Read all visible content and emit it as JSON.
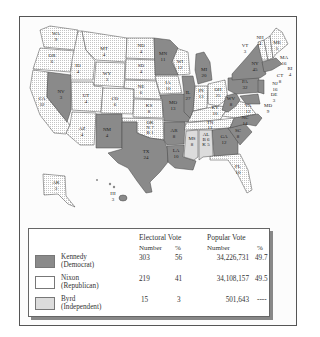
{
  "colors": {
    "democrat": "#8a8a8a",
    "republican_bg": "#ffffff",
    "republican_dots": "#bdbdbd",
    "independent": "#dcdcdc",
    "frame": "#555555",
    "background": "#fcfcfc"
  },
  "map": {
    "title": "",
    "states": [
      {
        "abbr": "WA",
        "ev": "9",
        "party": "R"
      },
      {
        "abbr": "OR",
        "ev": "6",
        "party": "R"
      },
      {
        "abbr": "CA",
        "ev": "32",
        "party": "R"
      },
      {
        "abbr": "ID",
        "ev": "4",
        "party": "R"
      },
      {
        "abbr": "NV",
        "ev": "3",
        "party": "D"
      },
      {
        "abbr": "MT",
        "ev": "4",
        "party": "R"
      },
      {
        "abbr": "WY",
        "ev": "3",
        "party": "R"
      },
      {
        "abbr": "UT",
        "ev": "4",
        "party": "R"
      },
      {
        "abbr": "AZ",
        "ev": "4",
        "party": "R"
      },
      {
        "abbr": "CO",
        "ev": "6",
        "party": "R"
      },
      {
        "abbr": "NM",
        "ev": "4",
        "party": "D"
      },
      {
        "abbr": "ND",
        "ev": "4",
        "party": "R"
      },
      {
        "abbr": "SD",
        "ev": "4",
        "party": "R"
      },
      {
        "abbr": "NE",
        "ev": "6",
        "party": "R"
      },
      {
        "abbr": "KS",
        "ev": "8",
        "party": "R"
      },
      {
        "abbr": "OK",
        "ev": "N 7 / B 1",
        "party": "R"
      },
      {
        "abbr": "TX",
        "ev": "24",
        "party": "D"
      },
      {
        "abbr": "MN",
        "ev": "11",
        "party": "D"
      },
      {
        "abbr": "IA",
        "ev": "10",
        "party": "R"
      },
      {
        "abbr": "MO",
        "ev": "13",
        "party": "D"
      },
      {
        "abbr": "AR",
        "ev": "8",
        "party": "D"
      },
      {
        "abbr": "LA",
        "ev": "10",
        "party": "D"
      },
      {
        "abbr": "WI",
        "ev": "12",
        "party": "R"
      },
      {
        "abbr": "IL",
        "ev": "27",
        "party": "D"
      },
      {
        "abbr": "MS",
        "ev": "8",
        "party": "I"
      },
      {
        "abbr": "MI",
        "ev": "20",
        "party": "D"
      },
      {
        "abbr": "IN",
        "ev": "13",
        "party": "R"
      },
      {
        "abbr": "KY",
        "ev": "10",
        "party": "R"
      },
      {
        "abbr": "TN",
        "ev": "11",
        "party": "R"
      },
      {
        "abbr": "AL",
        "ev": "K 5 / B 6",
        "party": "S"
      },
      {
        "abbr": "OH",
        "ev": "25",
        "party": "R"
      },
      {
        "abbr": "GA",
        "ev": "12",
        "party": "D"
      },
      {
        "abbr": "FL",
        "ev": "10",
        "party": "R"
      },
      {
        "abbr": "SC",
        "ev": "8",
        "party": "D"
      },
      {
        "abbr": "NC",
        "ev": "14",
        "party": "D"
      },
      {
        "abbr": "VA",
        "ev": "12",
        "party": "R"
      },
      {
        "abbr": "WV",
        "ev": "8",
        "party": "D"
      },
      {
        "abbr": "PA",
        "ev": "32",
        "party": "D"
      },
      {
        "abbr": "NY",
        "ev": "45",
        "party": "D"
      },
      {
        "abbr": "VT",
        "ev": "3",
        "party": "R"
      },
      {
        "abbr": "NH",
        "ev": "4",
        "party": "R"
      },
      {
        "abbr": "ME",
        "ev": "5",
        "party": "R"
      },
      {
        "abbr": "MA",
        "ev": "16",
        "party": "D"
      },
      {
        "abbr": "RI",
        "ev": "4",
        "party": "D"
      },
      {
        "abbr": "CT",
        "ev": "8",
        "party": "D"
      },
      {
        "abbr": "NJ",
        "ev": "16",
        "party": "D"
      },
      {
        "abbr": "DE",
        "ev": "3",
        "party": "D"
      },
      {
        "abbr": "MD",
        "ev": "9",
        "party": "D"
      },
      {
        "abbr": "AK",
        "ev": "3",
        "party": "R"
      },
      {
        "abbr": "HI",
        "ev": "3",
        "party": "D"
      }
    ]
  },
  "labels": {
    "WA": "WA",
    "WA_ev": "9",
    "OR": "OR",
    "OR_ev": "6",
    "CA": "CA",
    "CA_ev": "32",
    "ID": "ID",
    "ID_ev": "4",
    "NV": "NV",
    "NV_ev": "3",
    "MT": "MT",
    "MT_ev": "4",
    "WY": "WY",
    "WY_ev": "3",
    "UT": "UT",
    "UT_ev": "4",
    "AZ": "AZ",
    "AZ_ev": "4",
    "CO": "CO",
    "CO_ev": "6",
    "NM": "NM",
    "NM_ev": "4",
    "ND": "ND",
    "ND_ev": "4",
    "SD": "SD",
    "SD_ev": "4",
    "NE": "NE",
    "NE_ev": "6",
    "KS": "KS",
    "KS_ev": "8",
    "OK": "OK",
    "OK_ev1": "N 7",
    "OK_ev2": "B 1",
    "TX": "TX",
    "TX_ev": "24",
    "MN": "MN",
    "MN_ev": "11",
    "IA": "IA",
    "IA_ev": "10",
    "MO": "MO",
    "MO_ev": "13",
    "AR": "AR",
    "AR_ev": "8",
    "LA": "LA",
    "LA_ev": "10",
    "WI": "WI",
    "WI_ev": "12",
    "IL": "IL",
    "IL_ev": "27",
    "MS": "MS",
    "MS_ev": "8",
    "MI": "MI",
    "MI_ev": "20",
    "IN": "IN",
    "IN_ev": "13",
    "KY": "KY",
    "KY_ev": "10",
    "TN": "TN",
    "TN_ev": "11",
    "AL": "AL",
    "AL_ev1": "B 6",
    "AL_ev2": "K 5",
    "OH": "OH",
    "OH_ev": "25",
    "GA": "GA",
    "GA_ev": "12",
    "FL": "FL",
    "FL_ev": "10",
    "SC": "SC",
    "SC_ev": "8",
    "NC": "NC",
    "NC_ev": "14",
    "VA": "VA",
    "VA_ev": "12",
    "WV": "WV",
    "WV_ev": "8",
    "PA": "PA",
    "PA_ev": "32",
    "NY": "NY",
    "NY_ev": "45",
    "VT": "VT",
    "VT_ev": "3",
    "NH": "NH",
    "NH_ev": "4",
    "ME": "ME",
    "ME_ev": "5",
    "MA": "MA",
    "MA_ev": "16",
    "RI": "RI",
    "RI_ev": "4",
    "CT": "CT",
    "CT_ev": "8",
    "NJ": "NJ",
    "NJ_ev": "16",
    "DE": "DE",
    "DE_ev": "3",
    "MD": "MD",
    "MD_ev": "9",
    "AK": "AK",
    "AK_ev": "3",
    "HI": "HI",
    "HI_ev": "3"
  },
  "legend": {
    "headers": {
      "electoral": "Electoral Vote",
      "popular": "Popular Vote",
      "ev_number": "Number",
      "ev_pct": "%",
      "pv_number": "Number",
      "pv_pct": "%"
    },
    "rows": [
      {
        "name": "Kennedy",
        "party": "(Democrat)",
        "ev": "303",
        "ev_pct": "56",
        "pv": "34,226,731",
        "pv_pct": "49.7"
      },
      {
        "name": "Nixon",
        "party": "(Republican)",
        "ev": "219",
        "ev_pct": "41",
        "pv": "34,108,157",
        "pv_pct": "49.5"
      },
      {
        "name": "Byrd",
        "party": "(Independent)",
        "ev": "15",
        "ev_pct": "3",
        "pv": "501,643",
        "pv_pct": "----"
      }
    ]
  }
}
